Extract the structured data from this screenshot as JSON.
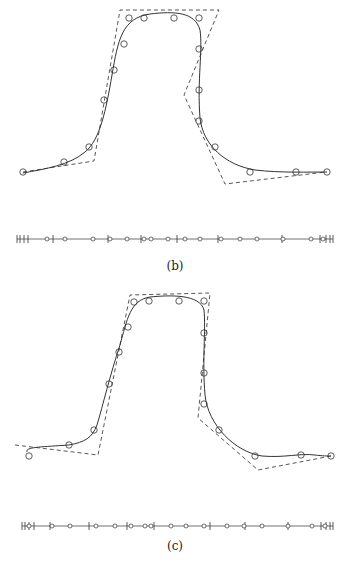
{
  "figures": [
    {
      "id": "b",
      "caption": "(b)",
      "data_points": [
        [
          23,
          172
        ],
        [
          64,
          162
        ],
        [
          89,
          147
        ],
        [
          104,
          100
        ],
        [
          114,
          70
        ],
        [
          124,
          44
        ],
        [
          129,
          18
        ],
        [
          144,
          18
        ],
        [
          174,
          18
        ],
        [
          199,
          18
        ],
        [
          199,
          49
        ],
        [
          199,
          90
        ],
        [
          199,
          121
        ],
        [
          215,
          147
        ],
        [
          250,
          172
        ],
        [
          296,
          172
        ],
        [
          327,
          172
        ]
      ],
      "control_polygon": [
        [
          23,
          172
        ],
        [
          94,
          161
        ],
        [
          120,
          10
        ],
        [
          219,
          10
        ],
        [
          184,
          95
        ],
        [
          225,
          184
        ],
        [
          326,
          172
        ]
      ],
      "curve": "M23,173 C45,169 70,165 85,152 C100,140 106,110 112,75 C118,40 122,18 150,14 C175,11 195,12 200,30 C203,50 197,80 200,118 C203,145 225,165 255,170 C280,173 310,172 327,172",
      "number_line": {
        "y": 239,
        "x_start": 17,
        "x_end": 333,
        "ticks": [
          17,
          20,
          24,
          28,
          53,
          108,
          141,
          177,
          218,
          282,
          320,
          326,
          330,
          333
        ],
        "circles": [
          47,
          65,
          93,
          110,
          127,
          144,
          151,
          168,
          185,
          200,
          221,
          240,
          257,
          283,
          311,
          323
        ]
      },
      "caption_pos": [
        175,
        268
      ]
    },
    {
      "id": "c",
      "caption": "(c)",
      "data_points": [
        [
          29,
          456
        ],
        [
          69,
          445
        ],
        [
          94,
          430
        ],
        [
          109,
          384
        ],
        [
          119,
          352
        ],
        [
          128,
          327
        ],
        [
          134,
          302
        ],
        [
          149,
          301
        ],
        [
          179,
          301
        ],
        [
          204,
          301
        ],
        [
          204,
          333
        ],
        [
          204,
          373
        ],
        [
          204,
          404
        ],
        [
          219,
          430
        ],
        [
          255,
          456
        ],
        [
          301,
          455
        ],
        [
          331,
          456
        ]
      ],
      "control_polygon": [
        [
          15,
          445
        ],
        [
          98,
          455
        ],
        [
          130,
          295
        ],
        [
          210,
          293
        ],
        [
          198,
          418
        ],
        [
          258,
          470
        ],
        [
          331,
          456
        ]
      ],
      "curve": "M27,452 C25,447 40,447 69,445 C85,442 92,438 97,425 C103,405 110,375 120,345 C127,320 130,300 150,297 C170,295 200,294 204,310 C206,330 202,360 205,395 C208,425 235,452 262,456 C285,458 300,453 315,455 C322,456 328,456 331,456",
      "number_line": {
        "y": 526,
        "x_start": 22,
        "x_end": 333,
        "ticks": [
          22,
          25,
          29,
          34,
          50,
          89,
          127,
          154,
          210,
          245,
          288,
          321,
          326,
          330,
          333
        ],
        "circles": [
          29,
          52,
          70,
          96,
          115,
          131,
          145,
          151,
          171,
          186,
          204,
          227,
          244,
          262,
          288,
          312,
          325
        ]
      },
      "caption_pos": [
        175,
        548
      ]
    }
  ],
  "style": {
    "stroke": "#333333",
    "dash_stroke": "#444444",
    "circle_radius": 3.2
  }
}
